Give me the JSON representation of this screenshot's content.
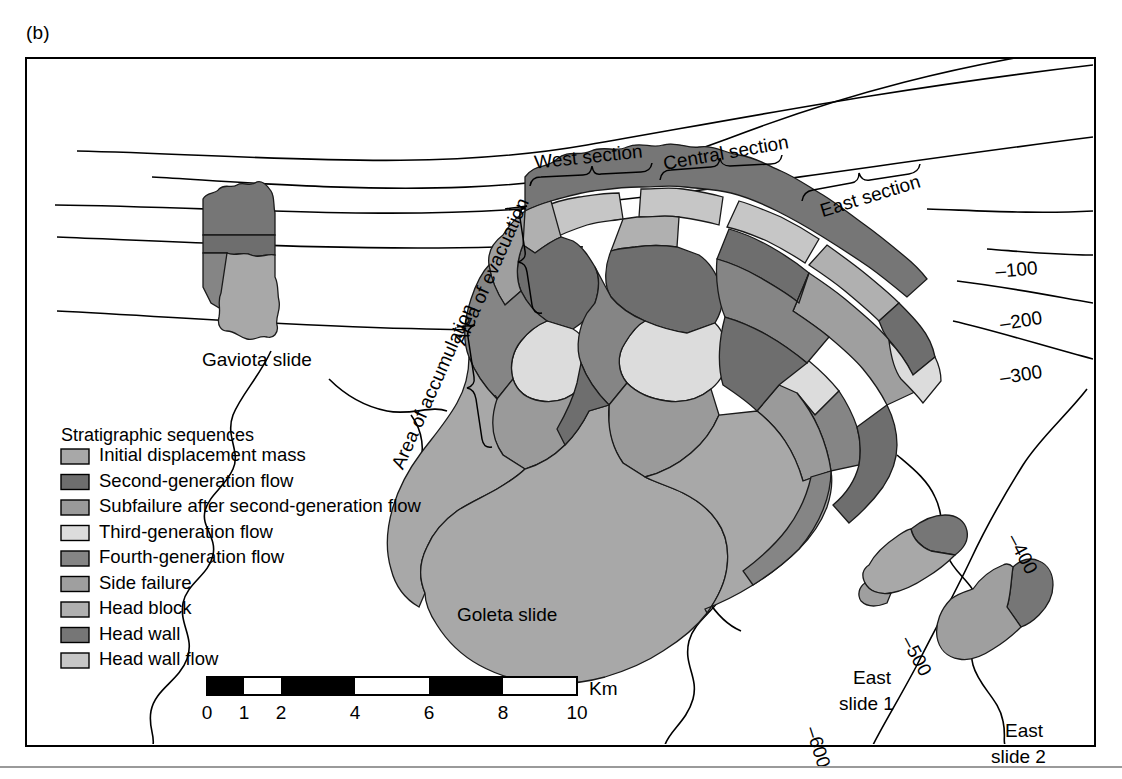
{
  "figure": {
    "panel_label": "(b)",
    "domain": "geologic-map"
  },
  "map": {
    "place_labels": [
      {
        "id": "gaviota",
        "text": "Gaviota slide",
        "x": 175,
        "y": 307
      },
      {
        "id": "goleta",
        "text": "Goleta slide",
        "x": 430,
        "y": 562
      },
      {
        "id": "east-slide-1-line1",
        "text": "East",
        "x": 826,
        "y": 625
      },
      {
        "id": "east-slide-1-line2",
        "text": "slide 1",
        "x": 812,
        "y": 651
      },
      {
        "id": "east-slide-2-line1",
        "text": "East",
        "x": 978,
        "y": 678
      },
      {
        "id": "east-slide-2-line2",
        "text": "slide 2",
        "x": 964,
        "y": 704
      }
    ],
    "section_labels": [
      {
        "id": "west-section",
        "text": "West section",
        "x": 562,
        "y": 104,
        "rotate": -6
      },
      {
        "id": "central-section",
        "text": "Central section",
        "x": 700,
        "y": 100,
        "rotate": -10
      },
      {
        "id": "east-section",
        "text": "East section",
        "x": 845,
        "y": 143,
        "rotate": -17
      }
    ],
    "rotated_labels": [
      {
        "id": "area-of-evacuation",
        "text": "Area of evacuation",
        "x": 470,
        "y": 215,
        "rotate": -66
      },
      {
        "id": "area-of-accumulation",
        "text": "Area of accumulation",
        "x": 412,
        "y": 330,
        "rotate": -66
      }
    ],
    "contour_labels": [
      {
        "id": "contour-100",
        "text": "–100",
        "x": 990,
        "y": 217,
        "rotate": -5
      },
      {
        "id": "contour-200",
        "text": "–200",
        "x": 995,
        "y": 268,
        "rotate": -9
      },
      {
        "id": "contour-300",
        "text": "–300",
        "x": 995,
        "y": 322,
        "rotate": -9
      },
      {
        "id": "contour-400",
        "text": "–400",
        "x": 990,
        "y": 498,
        "rotate": 62
      },
      {
        "id": "contour-500",
        "text": "–500",
        "x": 884,
        "y": 600,
        "rotate": 62
      },
      {
        "id": "contour-600",
        "text": "–600",
        "x": 785,
        "y": 690,
        "rotate": 72
      }
    ]
  },
  "legend": {
    "title": "Stratigraphic sequences",
    "items": [
      {
        "label": "Initial displacement mass",
        "color": "#a8a8a8"
      },
      {
        "label": "Second-generation flow",
        "color": "#6e6e6e"
      },
      {
        "label": "Subfailure after second-generation flow",
        "color": "#9a9a9a"
      },
      {
        "label": "Third-generation flow",
        "color": "#dcdcdc"
      },
      {
        "label": "Fourth-generation flow",
        "color": "#858585"
      },
      {
        "label": "Side failure",
        "color": "#9f9f9f"
      },
      {
        "label": "Head block",
        "color": "#b0b0b0"
      },
      {
        "label": "Head wall",
        "color": "#767676"
      },
      {
        "label": "Head wall flow",
        "color": "#c6c6c6"
      }
    ]
  },
  "scalebar": {
    "unit": "Km",
    "ticks": [
      "0",
      "1",
      "2",
      "4",
      "6",
      "8",
      "10"
    ],
    "segments": [
      {
        "from": "0",
        "to": "1",
        "fill": "black"
      },
      {
        "from": "1",
        "to": "2",
        "fill": "white"
      },
      {
        "from": "2",
        "to": "4",
        "fill": "black"
      },
      {
        "from": "4",
        "to": "6",
        "fill": "white"
      },
      {
        "from": "6",
        "to": "8",
        "fill": "black"
      },
      {
        "from": "8",
        "to": "10",
        "fill": "white"
      }
    ]
  },
  "palette": {
    "initial_displacement_mass": "#a8a8a8",
    "second_generation_flow": "#6e6e6e",
    "subfailure": "#9a9a9a",
    "third_generation_flow": "#dcdcdc",
    "fourth_generation_flow": "#858585",
    "side_failure": "#9f9f9f",
    "head_block": "#b0b0b0",
    "head_wall": "#767676",
    "head_wall_flow": "#c6c6c6",
    "outline": "#1a1a1a",
    "frame": "#000000"
  }
}
